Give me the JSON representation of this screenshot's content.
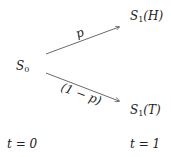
{
  "nodes": {
    "root": {
      "base": "S",
      "sub": "0"
    },
    "up": {
      "base": "S",
      "sub": "1",
      "suffix": "(H)"
    },
    "down": {
      "base": "S",
      "sub": "1",
      "suffix": "(T)"
    }
  },
  "edges": {
    "up_label": "p",
    "down_label": "(1 − p)"
  },
  "time": {
    "t0": "t = 0",
    "t1": "t = 1"
  },
  "colors": {
    "line": "#444444",
    "text": "#222222"
  }
}
